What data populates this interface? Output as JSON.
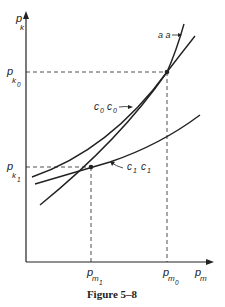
{
  "figure": {
    "caption": "Figure 5–8",
    "axes": {
      "y_label": "p",
      "y_sub": "k",
      "x_label": "p",
      "x_sub": "m"
    },
    "ticks": {
      "y": [
        {
          "label": "p",
          "sub": "k",
          "subsub": "0"
        },
        {
          "label": "p",
          "sub": "k",
          "subsub": "1"
        }
      ],
      "x": [
        {
          "label": "p",
          "sub": "m",
          "subsub": "1"
        },
        {
          "label": "p",
          "sub": "m",
          "subsub": "0"
        }
      ]
    },
    "curves": [
      {
        "name": "aa",
        "label": "a a"
      },
      {
        "name": "c0c0",
        "label_a": "c",
        "sub_a": "0",
        "label_b": "c",
        "sub_b": "0"
      },
      {
        "name": "c1c1",
        "label_a": "c",
        "sub_a": "1",
        "label_b": "c",
        "sub_b": "1"
      }
    ],
    "colors": {
      "ink": "#222222",
      "background": "#ffffff"
    }
  }
}
